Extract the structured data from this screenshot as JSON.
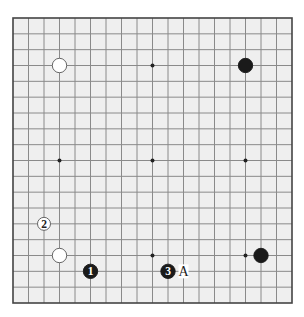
{
  "board": {
    "size": 19,
    "left": 13,
    "top": 18,
    "right": 292,
    "bottom": 303,
    "background": "#efefef",
    "line_color": "#8a8a8a",
    "border_color": "#444444",
    "star_points": [
      [
        3,
        3
      ],
      [
        9,
        3
      ],
      [
        15,
        3
      ],
      [
        3,
        9
      ],
      [
        9,
        9
      ],
      [
        15,
        9
      ],
      [
        3,
        15
      ],
      [
        9,
        15
      ],
      [
        15,
        15
      ]
    ]
  },
  "stones": [
    {
      "color": "white",
      "col": 3,
      "row": 3,
      "label": ""
    },
    {
      "color": "black",
      "col": 15,
      "row": 3,
      "label": ""
    },
    {
      "color": "white",
      "col": 3,
      "row": 15,
      "label": ""
    },
    {
      "color": "black",
      "col": 16,
      "row": 15,
      "label": ""
    },
    {
      "color": "black",
      "col": 5,
      "row": 16,
      "label": "1"
    },
    {
      "color": "white",
      "col": 2,
      "row": 13,
      "label": "2"
    },
    {
      "color": "black",
      "col": 10,
      "row": 16,
      "label": "3"
    }
  ],
  "markers": [
    {
      "col": 11,
      "row": 16,
      "label": "A"
    }
  ]
}
